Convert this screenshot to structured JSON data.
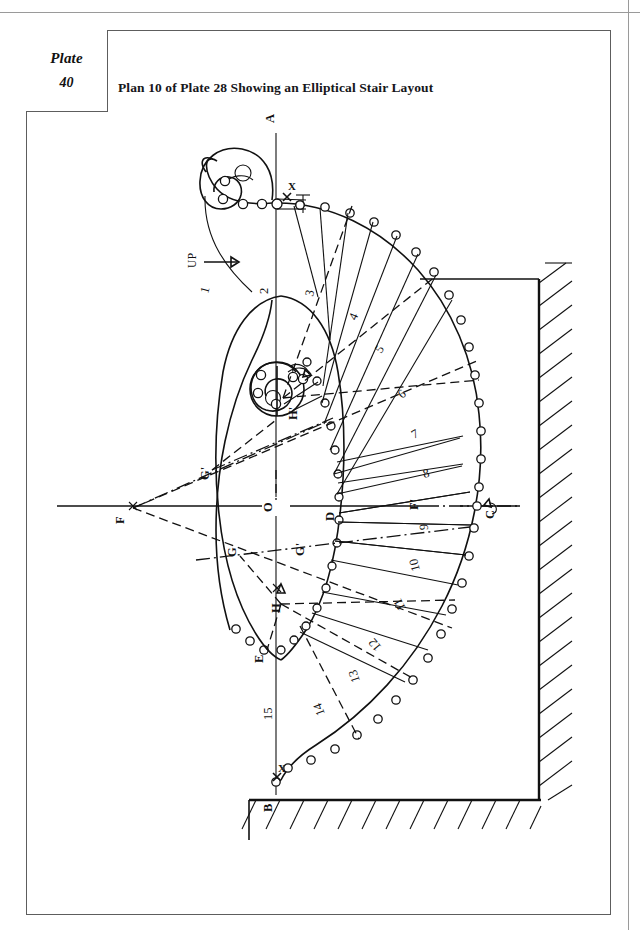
{
  "page": {
    "plate_label": "Plate",
    "plate_number": "40",
    "title": "Plan 10 of Plate 28 Showing an Elliptical Stair Layout"
  },
  "drawing": {
    "type": "elliptical-stair-plan",
    "axis_label_top": "A",
    "axis_label_bottom": "B",
    "direction_note": "UP",
    "cross_marks": [
      "X",
      "X"
    ],
    "point_labels": [
      {
        "id": "A",
        "text": "A",
        "x": 274,
        "y": 123
      },
      {
        "id": "B",
        "text": "B",
        "x": 272,
        "y": 808
      },
      {
        "id": "C",
        "text": "C",
        "x": 492,
        "y": 513
      },
      {
        "id": "D",
        "text": "D",
        "x": 337,
        "y": 515
      },
      {
        "id": "E",
        "text": "E",
        "x": 263,
        "y": 657
      },
      {
        "id": "F",
        "text": "F",
        "x": 125,
        "y": 519
      },
      {
        "id": "Fp",
        "text": "F'",
        "x": 420,
        "y": 505
      },
      {
        "id": "G1",
        "text": "G",
        "x": 238,
        "y": 551
      },
      {
        "id": "G2",
        "text": "G'",
        "x": 306,
        "y": 549
      },
      {
        "id": "G3",
        "text": "G'",
        "x": 211,
        "y": 473
      },
      {
        "id": "H1",
        "text": "H",
        "x": 281,
        "y": 607
      },
      {
        "id": "H2",
        "text": "H'",
        "x": 299,
        "y": 414
      },
      {
        "id": "O",
        "text": "O",
        "x": 277,
        "y": 506
      }
    ],
    "step_numbers": [
      "1",
      "2",
      "3",
      "4",
      "5",
      "6",
      "7",
      "8",
      "9",
      "10",
      "11",
      "12",
      "13",
      "14",
      "15"
    ],
    "riser_count": 15,
    "wall_note": "hatched masonry wall at right and bottom",
    "colors": {
      "ink": "#111111",
      "frame": "#5d5d5d",
      "paper": "#ffffff"
    }
  }
}
